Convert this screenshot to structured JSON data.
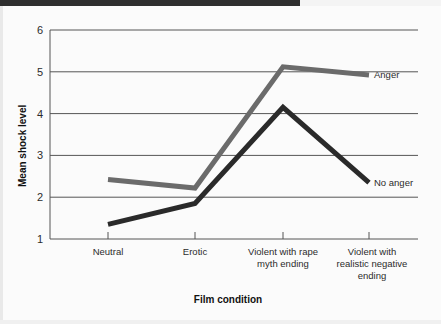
{
  "chart_data": {
    "type": "line",
    "title": "",
    "xlabel": "Film condition",
    "ylabel": "Mean shock level",
    "categories": [
      "Neutral",
      "Erotic",
      "Violent with rape myth ending",
      "Violent with realistic negative ending"
    ],
    "category_lines": [
      [
        "Neutral"
      ],
      [
        "Erotic"
      ],
      [
        "Violent with rape",
        "myth ending"
      ],
      [
        "Violent with",
        "realistic negative",
        "ending"
      ]
    ],
    "ylim": [
      1,
      6
    ],
    "yticks": [
      "1",
      "2",
      "3",
      "4",
      "5",
      "6"
    ],
    "grid": "horizontal",
    "legend_position": "right-inline",
    "series": [
      {
        "name": "Anger",
        "color": "#6b6b6b",
        "values": [
          2.42,
          2.22,
          5.12,
          4.92
        ]
      },
      {
        "name": "No anger",
        "color": "#2a2a2a",
        "values": [
          1.35,
          1.85,
          4.15,
          2.35
        ]
      }
    ]
  },
  "labels": {
    "y_axis_title": "Mean shock level",
    "x_axis_title": "Film condition",
    "series_anger": "Anger",
    "series_no_anger": "No anger",
    "ytick_6": "6",
    "ytick_5": "5",
    "ytick_4": "4",
    "ytick_3": "3",
    "ytick_2": "2",
    "ytick_1": "1",
    "cat_1_line_1": "Neutral",
    "cat_2_line_1": "Erotic",
    "cat_3_line_1": "Violent with rape",
    "cat_3_line_2": "myth ending",
    "cat_4_line_1": "Violent with",
    "cat_4_line_2": "realistic negative",
    "cat_4_line_3": "ending"
  },
  "colors": {
    "anger_line": "#6b6b6b",
    "no_anger_line": "#2a2a2a",
    "grid": "#555555",
    "axis": "#555555",
    "background": "#fbfbfb",
    "top_band": "#2f2f2f"
  }
}
